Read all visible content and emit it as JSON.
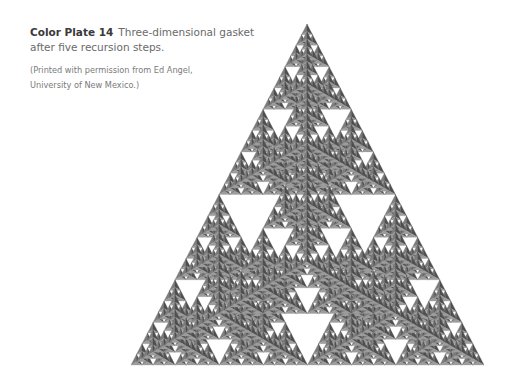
{
  "caption": {
    "label": "Color Plate 14",
    "text": "Three-dimensional gasket after five recursion steps.",
    "credit_line1": "(Printed with permission from Ed Angel,",
    "credit_line2": "University of New Mexico.)"
  },
  "figure": {
    "name": "three-dimensional-sierpinski-gasket",
    "recursion_steps": 5,
    "vertices": {
      "apex": [
        307,
        24
      ],
      "base_left": [
        131,
        365
      ],
      "base_right": [
        484,
        365
      ],
      "front": [
        307,
        262
      ]
    },
    "colors": {
      "left_face": "#7c7c7c",
      "right_face": "#4f4f4f",
      "bottom_face": "#9c9c9c",
      "background": "#ffffff"
    }
  }
}
